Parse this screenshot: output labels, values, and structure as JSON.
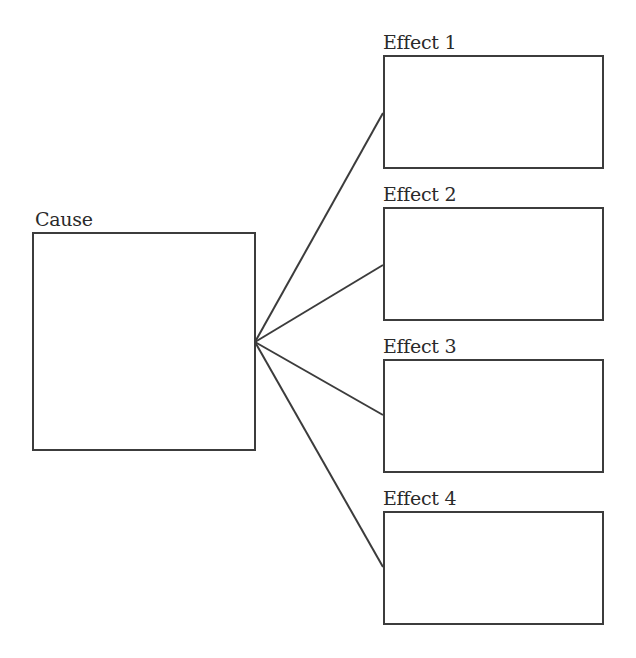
{
  "diagram": {
    "type": "cause-and-effect organizer",
    "cause": {
      "label": "Cause"
    },
    "effects": [
      {
        "label": "Effect 1"
      },
      {
        "label": "Effect 2"
      },
      {
        "label": "Effect 3"
      },
      {
        "label": "Effect 4"
      }
    ],
    "colors": {
      "stroke": "#3c3c3c",
      "text": "#2a2a2a",
      "background": "#ffffff"
    }
  }
}
